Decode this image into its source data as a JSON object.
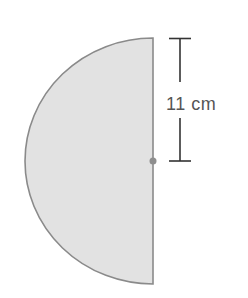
{
  "figure": {
    "shape": "semicircle",
    "fill_color": "#e2e2e2",
    "stroke_color": "#8a8a8a",
    "center_dot_color": "#8e8e8e",
    "dimension": {
      "label": "11 cm",
      "represents": "radius"
    }
  }
}
